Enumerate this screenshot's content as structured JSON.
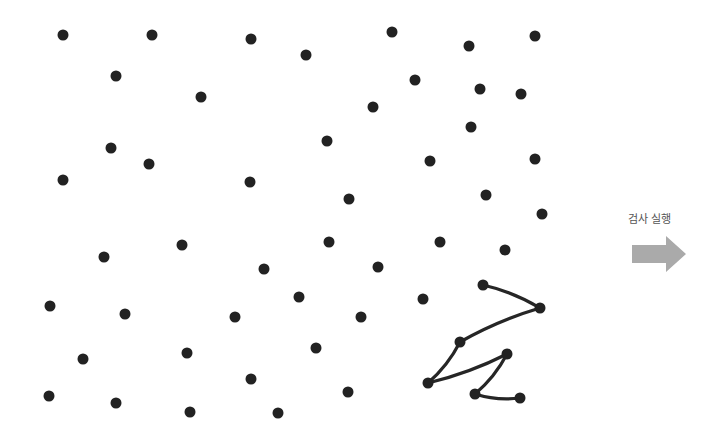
{
  "diagram": {
    "dot_color": "#222222",
    "line_color": "#262626",
    "dot_radius": 5.5,
    "dots": [
      [
        63,
        35
      ],
      [
        152,
        35
      ],
      [
        251,
        39
      ],
      [
        306,
        55
      ],
      [
        392,
        32
      ],
      [
        469,
        46
      ],
      [
        535,
        36
      ],
      [
        116,
        76
      ],
      [
        201,
        97
      ],
      [
        415,
        80
      ],
      [
        480,
        89
      ],
      [
        521,
        94
      ],
      [
        373,
        107
      ],
      [
        471,
        127
      ],
      [
        111,
        148
      ],
      [
        149,
        164
      ],
      [
        63,
        180
      ],
      [
        250,
        182
      ],
      [
        327,
        141
      ],
      [
        430,
        161
      ],
      [
        535,
        159
      ],
      [
        349,
        199
      ],
      [
        486,
        195
      ],
      [
        542,
        214
      ],
      [
        182,
        245
      ],
      [
        104,
        257
      ],
      [
        264,
        269
      ],
      [
        329,
        242
      ],
      [
        440,
        242
      ],
      [
        505,
        250
      ],
      [
        378,
        267
      ],
      [
        50,
        306
      ],
      [
        125,
        314
      ],
      [
        235,
        317
      ],
      [
        299,
        297
      ],
      [
        361,
        317
      ],
      [
        423,
        299
      ],
      [
        83,
        359
      ],
      [
        187,
        353
      ],
      [
        316,
        348
      ],
      [
        251,
        379
      ],
      [
        49,
        396
      ],
      [
        116,
        403
      ],
      [
        190,
        412
      ],
      [
        278,
        413
      ],
      [
        348,
        392
      ]
    ],
    "path": [
      [
        483,
        285
      ],
      [
        540,
        308
      ],
      [
        460,
        342
      ],
      [
        428,
        383
      ],
      [
        507,
        354
      ],
      [
        475,
        394
      ],
      [
        520,
        398
      ]
    ]
  },
  "action": {
    "label": "검사 실행",
    "arrow_color": "#aaaaaa"
  }
}
